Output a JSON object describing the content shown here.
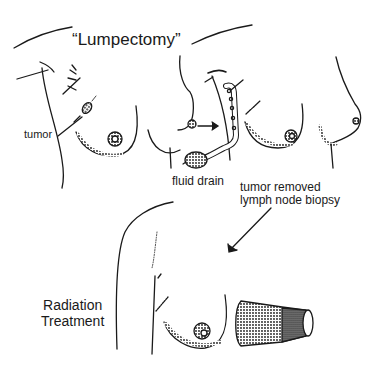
{
  "figure": {
    "title": "“Lumpectomy”",
    "labels": {
      "tumor": "tumor",
      "fluid_drain": "fluid drain",
      "tumor_removed_line1": "tumor removed",
      "tumor_removed_line2": "lymph node biopsy",
      "radiation_line1": "Radiation",
      "radiation_line2": "Treatment"
    },
    "colors": {
      "ink": "#1a1a1a",
      "background": "#ffffff"
    }
  }
}
